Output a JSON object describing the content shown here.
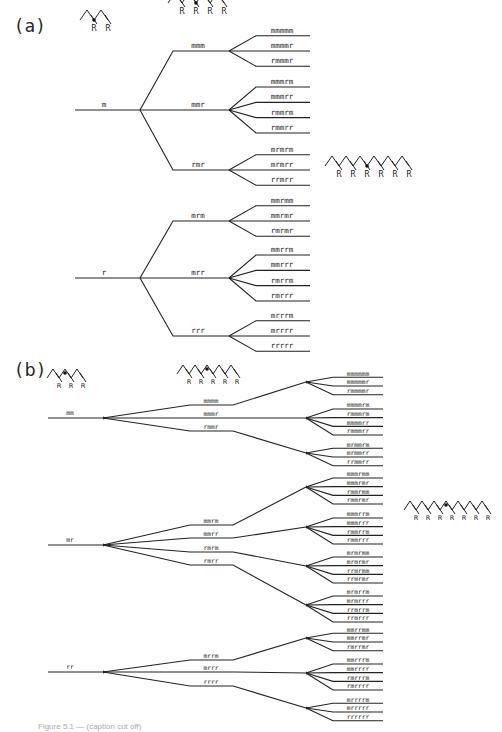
{
  "figure": {
    "caption_fragment": "Figure 5.1 — (caption cut off)",
    "colors": {
      "ink": "#222222",
      "background": "#ffffff"
    }
  },
  "panel_a": {
    "label": "(a)",
    "icons": [
      {
        "name": "dyad-icon",
        "x": 80,
        "y": 20,
        "units": 2,
        "labels": [
          "R",
          "R"
        ],
        "dot_after": 1
      },
      {
        "name": "tetrad-icon",
        "x": 168,
        "y": 3,
        "units": 4,
        "labels": [
          "R",
          "R",
          "R",
          "R"
        ],
        "dot_after": 2
      },
      {
        "name": "hexad-icon",
        "x": 325,
        "y": 166,
        "units": 6,
        "labels": [
          "R",
          "R",
          "R",
          "R",
          "R",
          "R"
        ],
        "dot_after": 3
      }
    ],
    "trees": [
      {
        "root": "m",
        "y": 110,
        "branches": [
          {
            "label": "mmm",
            "y": 51,
            "leaves": [
              "mmmmm",
              "mmmmr",
              "rmmmr"
            ]
          },
          {
            "label": "mmr",
            "y": 110,
            "leaves": [
              "mmmrm",
              "mmmrr",
              "rmmrm",
              "rmmrr"
            ]
          },
          {
            "label": "rmr",
            "y": 170,
            "leaves": [
              "mrmrm",
              "mrmrr",
              "rrmrr"
            ]
          }
        ]
      },
      {
        "root": "r",
        "y": 278,
        "branches": [
          {
            "label": "mrm",
            "y": 221,
            "leaves": [
              "mmrmm",
              "mmrmr",
              "rmrmr"
            ]
          },
          {
            "label": "mrr",
            "y": 278,
            "leaves": [
              "mmrrm",
              "mmrrr",
              "rmrrm",
              "rmrrr"
            ]
          },
          {
            "label": "rrr",
            "y": 336,
            "leaves": [
              "mrrrm",
              "mrrrr",
              "rrrrr"
            ]
          }
        ]
      }
    ]
  },
  "panel_b": {
    "label": "(b)",
    "icons": [
      {
        "name": "triad-icon",
        "x": 47,
        "y": 378,
        "units": 3,
        "labels": [
          "R",
          "R",
          "R"
        ],
        "dot_after": 1.5
      },
      {
        "name": "pentad-icon",
        "x": 177,
        "y": 374,
        "units": 5,
        "labels": [
          "R",
          "R",
          "R",
          "R",
          "R"
        ],
        "dot_after": 2.5
      },
      {
        "name": "heptad-icon",
        "x": 404,
        "y": 510,
        "units": 7,
        "labels": [
          "R",
          "R",
          "R",
          "R",
          "R",
          "R",
          "R"
        ],
        "dot_after": 3.5
      }
    ],
    "trees": [
      {
        "root": "mm",
        "y": 418,
        "branches": [
          {
            "label": "mmmm",
            "y": 405,
            "fan_y": 382,
            "leaves": [
              "mmmmmm",
              "mmmmmr",
              "rmmmmr"
            ]
          },
          {
            "label": "mmmr",
            "y": 418,
            "fan_y": 418,
            "leaves": [
              "mmmmrm",
              "rmmmrm",
              "mmmmrr",
              "rmmmrr"
            ]
          },
          {
            "label": "rmmr",
            "y": 431,
            "fan_y": 453,
            "leaves": [
              "mrmmrm",
              "mrmmrr",
              "rrmmrr"
            ]
          }
        ]
      },
      {
        "root": "mr",
        "y": 545,
        "branches": [
          {
            "label": "mmrm",
            "y": 525,
            "fan_y": 487,
            "leaves": [
              "mmmrmm",
              "mmmrmr",
              "rmmrmm",
              "rmmrmr"
            ]
          },
          {
            "label": "mmrr",
            "y": 538,
            "fan_y": 527,
            "leaves": [
              "mmmrrm",
              "mmmrrr",
              "rmmrrm",
              "rmmrrr"
            ]
          },
          {
            "label": "rmrm",
            "y": 552,
            "fan_y": 566,
            "leaves": [
              "mrmrmm",
              "mrmrmr",
              "rrmrmm",
              "rrmrmr"
            ]
          },
          {
            "label": "rmrr",
            "y": 565,
            "fan_y": 605,
            "leaves": [
              "mrmrrm",
              "mrmrrr",
              "rrmrrm",
              "rrmrrr"
            ]
          }
        ]
      },
      {
        "root": "rr",
        "y": 672,
        "branches": [
          {
            "label": "mrrm",
            "y": 660,
            "fan_y": 638,
            "leaves": [
              "mmrrmm",
              "mmrrmr",
              "rmrrmr"
            ]
          },
          {
            "label": "mrrr",
            "y": 672,
            "fan_y": 673,
            "leaves": [
              "mmrrrm",
              "mmrrrr",
              "rmrrrm",
              "rmrrrr"
            ]
          },
          {
            "label": "rrrr",
            "y": 686,
            "fan_y": 708,
            "leaves": [
              "mrrrrm",
              "mrrrrr",
              "rrrrrr"
            ]
          }
        ]
      }
    ]
  }
}
